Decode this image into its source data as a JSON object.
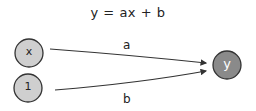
{
  "diagram": {
    "title": "y = ax + b",
    "nodes": [
      {
        "id": "x",
        "label": "x",
        "fill": "#cfcfcf",
        "text_color": "#222222"
      },
      {
        "id": "one",
        "label": "1",
        "fill": "#cfcfcf",
        "text_color": "#222222"
      },
      {
        "id": "y",
        "label": "y",
        "fill": "#8a8a8a",
        "text_color": "#ffffff"
      }
    ],
    "edges": [
      {
        "from": "x",
        "to": "y",
        "label": "a"
      },
      {
        "from": "one",
        "to": "y",
        "label": "b"
      }
    ],
    "colors": {
      "stroke": "#333333",
      "light_node": "#cfcfcf",
      "dark_node": "#8a8a8a"
    }
  }
}
